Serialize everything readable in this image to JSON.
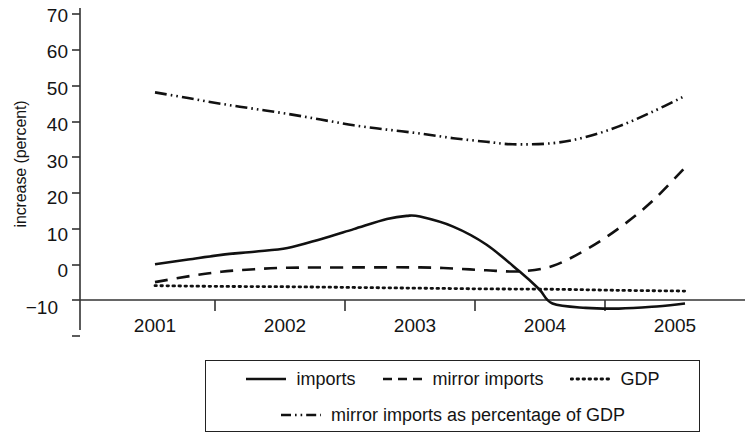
{
  "chart_data": {
    "type": "line",
    "title": "",
    "subtitle": "",
    "xlabel": "",
    "ylabel": "increase (percent)",
    "xlim": [
      2001,
      2005
    ],
    "ylim": [
      -10,
      70
    ],
    "grid": false,
    "legend_position": "bottom",
    "x_tick_labels": [
      "2001",
      "2002",
      "2003",
      "2004",
      "2005"
    ],
    "y_tick_labels": [
      "70",
      "60",
      "50",
      "40",
      "30",
      "20",
      "10",
      "0",
      "−10"
    ],
    "y_ticks": [
      70,
      60,
      50,
      40,
      30,
      20,
      10,
      0,
      -10
    ],
    "x": [
      2001,
      2002,
      2003,
      2004,
      2005
    ],
    "series": [
      {
        "name": "imports",
        "style": "solid",
        "color": "#111111",
        "values": [
          10,
          14.5,
          23.5,
          -1.5,
          -1
        ],
        "points": [
          [
            2001.0,
            10.0
          ],
          [
            2001.25,
            11.3
          ],
          [
            2001.5,
            12.6
          ],
          [
            2001.75,
            13.5
          ],
          [
            2002.0,
            14.5
          ],
          [
            2002.25,
            17.0
          ],
          [
            2002.5,
            19.8
          ],
          [
            2002.75,
            22.6
          ],
          [
            2002.9,
            23.5
          ],
          [
            2003.0,
            23.3
          ],
          [
            2003.25,
            20.5
          ],
          [
            2003.5,
            15.5
          ],
          [
            2003.75,
            8.0
          ],
          [
            2003.9,
            3.0
          ],
          [
            2004.0,
            -1.0
          ],
          [
            2004.25,
            -2.2
          ],
          [
            2004.5,
            -2.4
          ],
          [
            2004.75,
            -1.9
          ],
          [
            2005.0,
            -1.0
          ]
        ]
      },
      {
        "name": "mirror imports",
        "style": "dashed",
        "color": "#111111",
        "values": [
          5,
          9,
          9,
          8.5,
          37
        ],
        "points": [
          [
            2001.0,
            5.0
          ],
          [
            2001.25,
            6.6
          ],
          [
            2001.5,
            7.9
          ],
          [
            2001.75,
            8.6
          ],
          [
            2002.0,
            9.0
          ],
          [
            2002.5,
            9.1
          ],
          [
            2003.0,
            9.1
          ],
          [
            2003.25,
            8.8
          ],
          [
            2003.5,
            8.3
          ],
          [
            2003.75,
            8.0
          ],
          [
            2004.0,
            9.5
          ],
          [
            2004.25,
            14.0
          ],
          [
            2004.5,
            20.0
          ],
          [
            2004.75,
            27.5
          ],
          [
            2005.0,
            37.0
          ]
        ]
      },
      {
        "name": "GDP",
        "style": "dotted",
        "color": "#111111",
        "values": [
          4,
          3.7,
          3.3,
          3.0,
          2.5
        ],
        "points": [
          [
            2001.0,
            4.0
          ],
          [
            2001.5,
            3.8
          ],
          [
            2002.0,
            3.7
          ],
          [
            2002.5,
            3.5
          ],
          [
            2003.0,
            3.3
          ],
          [
            2003.5,
            3.1
          ],
          [
            2004.0,
            3.0
          ],
          [
            2004.5,
            2.7
          ],
          [
            2005.0,
            2.5
          ]
        ]
      },
      {
        "name": "mirror imports as percentage of GDP",
        "style": "dashdot",
        "color": "#111111",
        "values": [
          58,
          52,
          47,
          43.5,
          57
        ],
        "points": [
          [
            2001.0,
            58.0
          ],
          [
            2001.25,
            56.4
          ],
          [
            2001.5,
            54.8
          ],
          [
            2001.75,
            53.4
          ],
          [
            2002.0,
            52.0
          ],
          [
            2002.25,
            50.4
          ],
          [
            2002.5,
            48.8
          ],
          [
            2002.75,
            47.6
          ],
          [
            2003.0,
            46.5
          ],
          [
            2003.25,
            45.2
          ],
          [
            2003.5,
            44.2
          ],
          [
            2003.7,
            43.5
          ],
          [
            2004.0,
            43.8
          ],
          [
            2004.25,
            45.5
          ],
          [
            2004.5,
            48.5
          ],
          [
            2004.75,
            52.5
          ],
          [
            2005.0,
            57.0
          ]
        ]
      }
    ],
    "legend": [
      {
        "label": "imports",
        "style": "solid"
      },
      {
        "label": "mirror imports",
        "style": "dashed"
      },
      {
        "label": "GDP",
        "style": "dotted"
      },
      {
        "label": "mirror imports as percentage of GDP",
        "style": "dashdot"
      }
    ]
  }
}
